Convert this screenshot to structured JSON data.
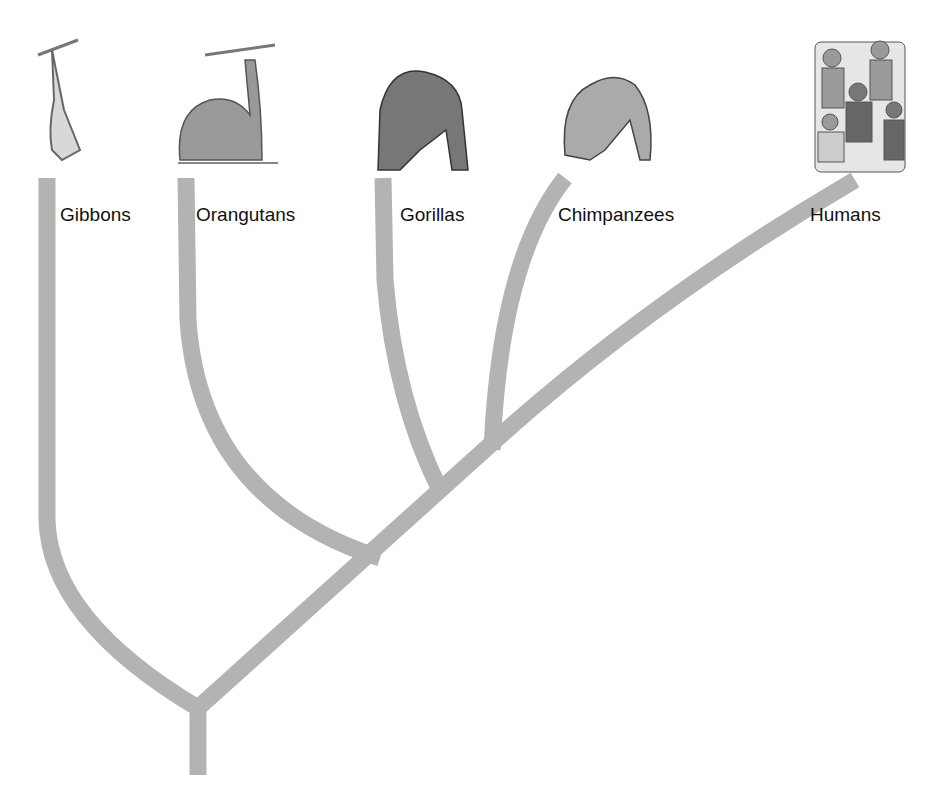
{
  "diagram": {
    "type": "phylogenetic-tree",
    "branch_color": "#b3b3b3",
    "taxa": [
      {
        "label": "Gibbons",
        "icon": "gibbon-illustration"
      },
      {
        "label": "Orangutans",
        "icon": "orangutan-illustration"
      },
      {
        "label": "Gorillas",
        "icon": "gorilla-illustration"
      },
      {
        "label": "Chimpanzees",
        "icon": "chimpanzee-illustration"
      },
      {
        "label": "Humans",
        "icon": "humans-photo"
      }
    ]
  }
}
